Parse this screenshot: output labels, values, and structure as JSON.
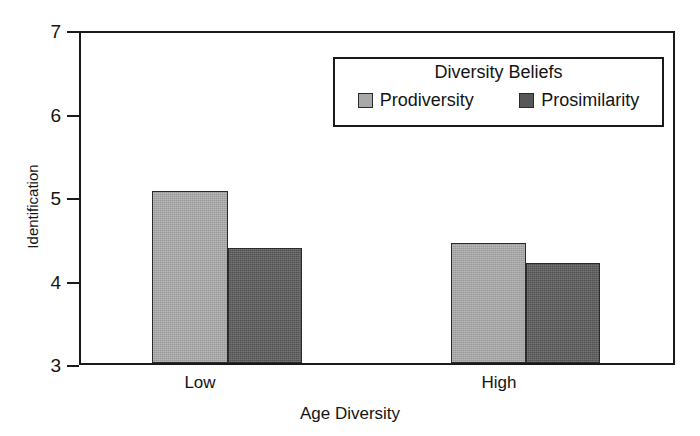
{
  "chart_data": {
    "type": "bar",
    "title": "",
    "xlabel": "Age Diversity",
    "ylabel": "Identification",
    "categories": [
      "Low",
      "High"
    ],
    "ylim": [
      3,
      7
    ],
    "yticks": [
      3,
      4,
      5,
      6,
      7
    ],
    "grid": false,
    "legend_title": "Diversity Beliefs",
    "legend_position": "top-right-inside",
    "series": [
      {
        "name": "Prodiversity",
        "color": "#a9a9a9",
        "values": [
          5.08,
          4.46
        ]
      },
      {
        "name": "Prosimilarity",
        "color": "#585858",
        "values": [
          4.4,
          4.21
        ]
      }
    ]
  },
  "axis": {
    "y_title": "Identification",
    "x_title": "Age Diversity",
    "y_tick_labels": [
      "7",
      "6",
      "5",
      "4",
      "3"
    ],
    "x_tick_labels": [
      "Low",
      "High"
    ]
  },
  "legend": {
    "title": "Diversity Beliefs",
    "items": [
      {
        "label": "Prodiversity",
        "color": "#a9a9a9"
      },
      {
        "label": "Prosimilarity",
        "color": "#585858"
      }
    ]
  },
  "colors": {
    "prodiversity": "#a9a9a9",
    "prosimilarity": "#585858",
    "axis": "#1a1a1a",
    "background": "#ffffff"
  }
}
